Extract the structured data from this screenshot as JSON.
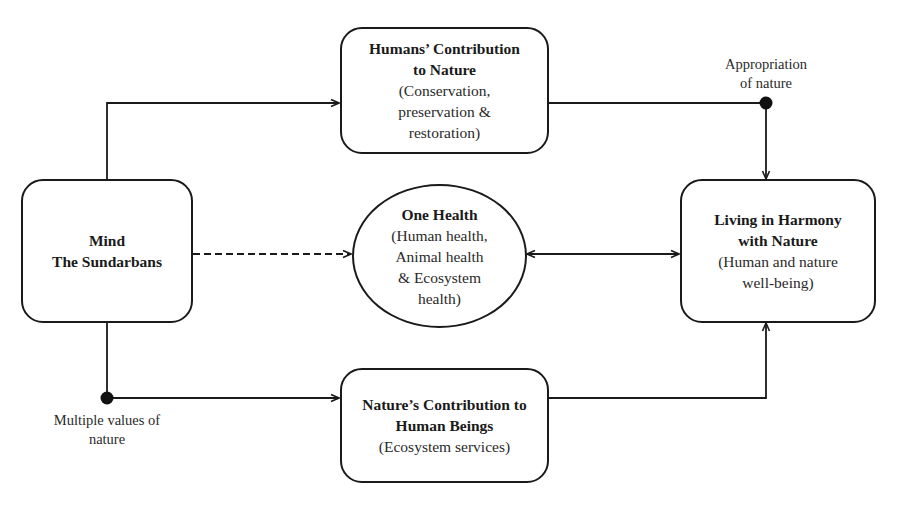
{
  "diagram": {
    "nodes": {
      "mind": {
        "title_lines": [
          "Mind",
          "The Sundarbans"
        ],
        "sub_lines": []
      },
      "humans_contribution": {
        "title_lines": [
          "Humans’ Contribution",
          "to Nature"
        ],
        "sub_lines": [
          "(Conservation,",
          "preservation &",
          "restoration)"
        ]
      },
      "one_health": {
        "title_lines": [
          "One Health"
        ],
        "sub_lines": [
          "(Human health,",
          "Animal health",
          "& Ecosystem",
          "health)"
        ]
      },
      "living_harmony": {
        "title_lines": [
          "Living in Harmony",
          "with Nature"
        ],
        "sub_lines": [
          "(Human and nature",
          "well-being)"
        ]
      },
      "natures_contribution": {
        "title_lines": [
          "Nature’s Contribution to",
          "Human Beings"
        ],
        "sub_lines": [
          "(Ecosystem services)"
        ]
      }
    },
    "labels": {
      "appropriation": [
        "Appropriation",
        "of nature"
      ],
      "multiple_values": [
        "Multiple values of",
        "nature"
      ]
    },
    "edges": [
      {
        "from": "mind",
        "to": "humans_contribution",
        "style": "solid",
        "arrow": "end"
      },
      {
        "from": "mind",
        "to": "one_health",
        "style": "dashed",
        "arrow": "end"
      },
      {
        "from": "mind",
        "to": "natures_contribution",
        "style": "solid",
        "arrow": "end",
        "junction_label": "multiple_values"
      },
      {
        "from": "humans_contribution",
        "to": "living_harmony",
        "style": "solid",
        "arrow": "end",
        "junction_label": "appropriation"
      },
      {
        "from": "one_health",
        "to": "living_harmony",
        "style": "solid",
        "arrow": "both"
      },
      {
        "from": "natures_contribution",
        "to": "living_harmony",
        "style": "solid",
        "arrow": "end"
      }
    ],
    "colors": {
      "stroke": "#1a1a1a",
      "background": "#ffffff"
    }
  }
}
